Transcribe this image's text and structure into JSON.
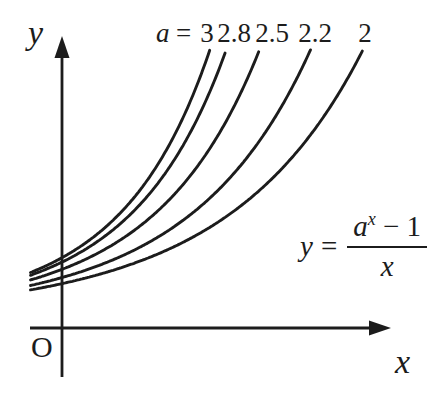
{
  "background": "#ffffff",
  "ink": "#1c1c1c",
  "axes": {
    "y_label": "y",
    "x_label": "x",
    "origin_label": "O"
  },
  "legend": {
    "var": "a",
    "eq": "=",
    "values": [
      "3",
      "2.8",
      "2.5",
      "2.2",
      "2"
    ]
  },
  "formula": {
    "lhs_var": "y",
    "eq": "=",
    "num_base": "a",
    "num_sup": "x",
    "num_tail": "− 1",
    "den": "x"
  },
  "chart_data": {
    "type": "line",
    "formula": "y = (a^x − 1)/x",
    "parameter": "a",
    "series": [
      {
        "name": "a=3",
        "a": 3,
        "y_axis_crossing": 1.099
      },
      {
        "name": "a=2.8",
        "a": 2.8,
        "y_axis_crossing": 1.03
      },
      {
        "name": "a=2.5",
        "a": 2.5,
        "y_axis_crossing": 0.916
      },
      {
        "name": "a=2.2",
        "a": 2.2,
        "y_axis_crossing": 0.788
      },
      {
        "name": "a=2",
        "a": 2,
        "y_axis_crossing": 0.693
      }
    ],
    "x_start": -0.45,
    "y_clip": 4.35,
    "sample_step": 0.02,
    "axes": {
      "x_label": "x",
      "y_label": "y",
      "origin_label": "O",
      "ticks": false,
      "grid": false
    },
    "legend_position": "top",
    "pixel_mapping": {
      "origin_px": [
        62,
        328
      ],
      "px_per_unit_x": 70,
      "px_per_unit_y": 64
    }
  }
}
